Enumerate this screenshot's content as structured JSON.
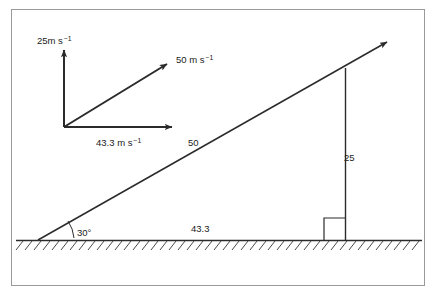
{
  "figure": {
    "background_color": "#ffffff",
    "frame_color": "#9a9a9a",
    "line_color": "#2b2b2b",
    "ground": {
      "label": "ground-hatched-line",
      "hatch_color": "#4a4a4a"
    },
    "triangle": {
      "hypotenuse_label": "50",
      "vertical_label": "25",
      "base_label": "43.3",
      "angle_label": "30°"
    },
    "vectors": {
      "vertical": {
        "value": "25m s",
        "exponent": "−1",
        "name": "vertical-velocity-vector"
      },
      "resultant": {
        "value": "50 m s",
        "exponent": "−1",
        "name": "resultant-velocity-vector"
      },
      "horizontal": {
        "value": "43.3 m s",
        "exponent": "−1",
        "name": "horizontal-velocity-vector"
      }
    }
  }
}
